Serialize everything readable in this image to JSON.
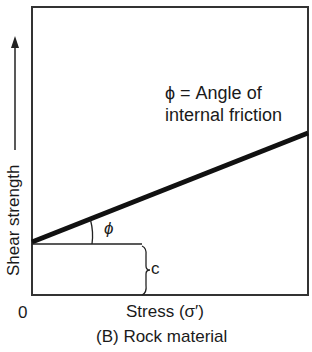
{
  "diagram": {
    "caption": "(B)  Rock material",
    "y_axis_label": "Shear strength",
    "x_axis_label": "Stress (σ′)",
    "origin_label": "0",
    "annotation_line1": "ϕ = Angle of",
    "annotation_line2": "internal friction",
    "angle_symbol": "ϕ",
    "intercept_label": "c",
    "colors": {
      "line": "#111111",
      "frame": "#333333",
      "background": "#ffffff"
    }
  }
}
